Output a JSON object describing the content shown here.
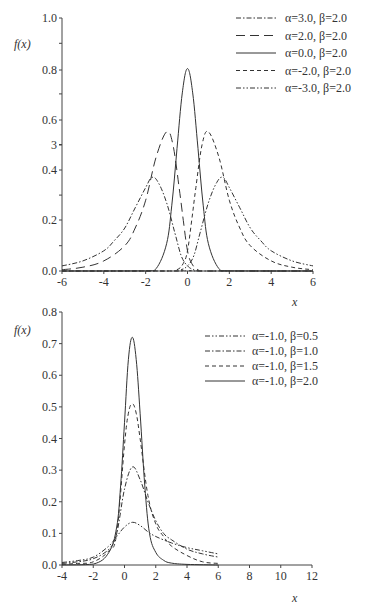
{
  "chart_data": [
    {
      "type": "line",
      "ylabel": "f(x)",
      "xlabel": "x",
      "xlim": [
        -6,
        6
      ],
      "ylim": [
        0,
        1.0
      ],
      "x_ticks": [
        "-6",
        "-4",
        "-2",
        "0",
        "2",
        "4",
        "6"
      ],
      "y_ticks": [
        "0.0",
        "0.2",
        "0.4",
        "3",
        "0.6",
        "0.8",
        "1.0"
      ],
      "grid": false,
      "legend_position": "upper right",
      "series": [
        {
          "name": "α=3.0, β=2.0",
          "style": "dash-dot",
          "x": [
            -6,
            -5,
            -4,
            -3.5,
            -3,
            -2.5,
            -2,
            -1.7,
            -1.4,
            -1,
            -0.6,
            -0.3,
            0,
            0.3,
            0.6,
            6
          ],
          "y": [
            0.02,
            0.04,
            0.08,
            0.12,
            0.17,
            0.25,
            0.33,
            0.37,
            0.35,
            0.27,
            0.15,
            0.06,
            0.02,
            0.005,
            0,
            0
          ]
        },
        {
          "name": "α=2.0, β=2.0",
          "style": "long-dash",
          "x": [
            -6,
            -5,
            -4,
            -3,
            -2.5,
            -2,
            -1.5,
            -1,
            -0.7,
            -0.4,
            -0.2,
            0,
            0.2,
            0.5,
            1,
            6
          ],
          "y": [
            0.005,
            0.015,
            0.04,
            0.1,
            0.17,
            0.28,
            0.45,
            0.55,
            0.5,
            0.33,
            0.2,
            0.08,
            0.03,
            0.005,
            0,
            0
          ]
        },
        {
          "name": "α=0.0, β=2.0",
          "style": "solid",
          "x": [
            -6,
            -2,
            -1.5,
            -1,
            -0.75,
            -0.5,
            -0.25,
            0,
            0.25,
            0.5,
            0.75,
            1,
            1.5,
            2,
            6
          ],
          "y": [
            0,
            0.0003,
            0.009,
            0.108,
            0.26,
            0.484,
            0.704,
            0.8,
            0.704,
            0.484,
            0.26,
            0.108,
            0.009,
            0.0003,
            0
          ]
        },
        {
          "name": "α=-2.0, β=2.0",
          "style": "short-dash",
          "x": [
            -6,
            -1,
            -0.5,
            -0.2,
            0,
            0.2,
            0.4,
            0.7,
            1,
            1.5,
            2,
            2.5,
            3,
            4,
            5,
            6
          ],
          "y": [
            0,
            0,
            0.005,
            0.03,
            0.08,
            0.2,
            0.33,
            0.5,
            0.55,
            0.45,
            0.28,
            0.17,
            0.1,
            0.04,
            0.015,
            0.005
          ]
        },
        {
          "name": "α=-3.0, β=2.0",
          "style": "dash-dot-dot",
          "x": [
            -6,
            -0.6,
            -0.3,
            0,
            0.3,
            0.6,
            1,
            1.4,
            1.7,
            2,
            2.5,
            3,
            3.5,
            4,
            5,
            6
          ],
          "y": [
            0,
            0,
            0.005,
            0.02,
            0.06,
            0.15,
            0.27,
            0.35,
            0.37,
            0.33,
            0.25,
            0.17,
            0.12,
            0.08,
            0.04,
            0.02
          ]
        }
      ]
    },
    {
      "type": "line",
      "ylabel": "f(x)",
      "xlabel": "x",
      "xlim": [
        -4,
        12
      ],
      "ylim": [
        0,
        0.8
      ],
      "x_ticks": [
        "-4",
        "-2",
        "0",
        "2",
        "4",
        "6",
        "8",
        "10",
        "12"
      ],
      "y_ticks": [
        "0.0",
        "0.1",
        "0.2",
        "0.3",
        "0.4",
        "0.5",
        "0.6",
        "0.7",
        "0.8"
      ],
      "grid": false,
      "legend_position": "upper right",
      "series": [
        {
          "name": "α=-1.0, β=0.5",
          "style": "dash-dot-dot",
          "x": [
            -4,
            -3,
            -2,
            -1,
            -0.5,
            0,
            0.5,
            1,
            1.5,
            2,
            3,
            4,
            5,
            6
          ],
          "y": [
            0.008,
            0.014,
            0.025,
            0.06,
            0.09,
            0.12,
            0.135,
            0.125,
            0.105,
            0.09,
            0.07,
            0.055,
            0.045,
            0.035
          ]
        },
        {
          "name": "α=-1.0, β=1.0",
          "style": "dash-dot",
          "x": [
            -4,
            -3,
            -2,
            -1,
            -0.5,
            0,
            0.5,
            1,
            1.5,
            2,
            2.5,
            3,
            4,
            5,
            6
          ],
          "y": [
            0.005,
            0.01,
            0.02,
            0.05,
            0.1,
            0.24,
            0.31,
            0.27,
            0.2,
            0.14,
            0.1,
            0.08,
            0.05,
            0.035,
            0.025
          ]
        },
        {
          "name": "α=-1.0, β=1.5",
          "style": "short-dash",
          "x": [
            -4,
            -3,
            -2,
            -1,
            -0.5,
            0,
            0.25,
            0.5,
            0.75,
            1,
            1.5,
            2,
            2.5,
            3,
            4,
            5,
            6
          ],
          "y": [
            0.002,
            0.005,
            0.01,
            0.045,
            0.1,
            0.38,
            0.48,
            0.51,
            0.48,
            0.4,
            0.22,
            0.13,
            0.09,
            0.06,
            0.03,
            0.01,
            0.005
          ]
        },
        {
          "name": "α=-1.0, β=2.0",
          "style": "solid",
          "x": [
            -4,
            -2,
            -1,
            -0.5,
            -0.25,
            0,
            0.25,
            0.5,
            0.75,
            1,
            1.3,
            1.6,
            2,
            2.5,
            3,
            4,
            6
          ],
          "y": [
            0,
            0.003,
            0.04,
            0.12,
            0.25,
            0.45,
            0.65,
            0.72,
            0.65,
            0.48,
            0.25,
            0.1,
            0.04,
            0.015,
            0.006,
            0.002,
            0
          ]
        }
      ]
    }
  ]
}
